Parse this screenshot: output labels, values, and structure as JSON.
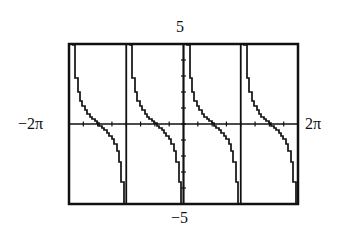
{
  "chart_data": {
    "type": "line",
    "title": "",
    "function": "cot(x)",
    "xlabel": "",
    "ylabel": "",
    "xlim_labels": {
      "min": "−2π",
      "max": "2π"
    },
    "ylim_labels": {
      "min": "−5",
      "max": "5"
    },
    "xlim": [
      -6.2832,
      6.2832
    ],
    "ylim": [
      -5,
      5
    ],
    "x_tick_step": "π/4",
    "y_tick_step": 1,
    "grid": false,
    "asymptotes": [
      "-2π",
      "-π",
      "0",
      "π",
      "2π"
    ],
    "x_intercepts": [
      "-3π/2",
      "-π/2",
      "π/2",
      "3π/2"
    ],
    "series": [
      {
        "name": "y = cot x",
        "color": "#111111",
        "style": "calculator-stepped"
      }
    ]
  },
  "labels": {
    "ymax": "5",
    "ymin": "−5",
    "xmin": "−2π",
    "xmax": "2π"
  },
  "colors": {
    "ink": "#111111",
    "background": "#ffffff"
  }
}
